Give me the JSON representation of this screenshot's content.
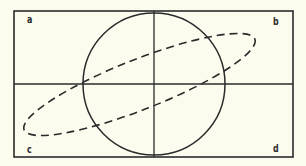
{
  "diagram": {
    "colors": {
      "background": "#fbfbee",
      "stroke": "#2b2b2b"
    },
    "frame": {
      "x": 14,
      "y": 11,
      "width": 279,
      "height": 146
    },
    "axes": {
      "vertical_x": 154,
      "horizontal_y": 84
    },
    "circle": {
      "cx": 154,
      "cy": 84,
      "r": 71,
      "style": "solid"
    },
    "ellipse": {
      "cx": 139.5,
      "cy": 84.5,
      "rx": 124,
      "ry": 25,
      "rotation_deg": -21.5,
      "style": "dashed"
    },
    "corner_labels": {
      "top_left": "a",
      "top_right": "b",
      "bottom_left": "c",
      "bottom_right": "d"
    }
  }
}
